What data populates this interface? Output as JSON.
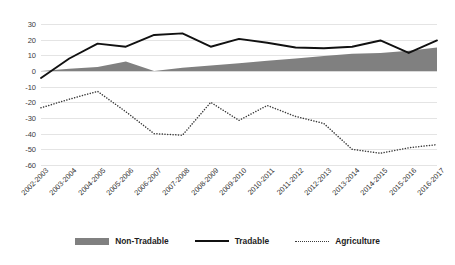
{
  "chart_data": {
    "type": "line",
    "title": "",
    "xlabel": "",
    "ylabel": "",
    "ylim": [
      -60,
      30
    ],
    "yticks": [
      30,
      20,
      10,
      0,
      -10,
      -20,
      -30,
      -40,
      -50,
      -60
    ],
    "grid": true,
    "legend_position": "bottom",
    "categories": [
      "2002-2003",
      "2003-2004",
      "2004-2005",
      "2005-2006",
      "2006-2007",
      "2007-2008",
      "2008-2009",
      "2009-2010",
      "2010-2011",
      "2011-2012",
      "2012-2013",
      "2013-2014",
      "2014-2015",
      "2015-2016",
      "2016-2017"
    ],
    "series": [
      {
        "name": "Non-Tradable",
        "style": "area",
        "color": "#808080",
        "values": [
          0,
          1.5,
          2.5,
          6,
          0,
          2,
          3.5,
          5,
          6.5,
          8,
          9.5,
          11,
          11.5,
          13,
          15
        ]
      },
      {
        "name": "Tradable",
        "style": "solid-line",
        "color": "#111111",
        "values": [
          -4.5,
          8,
          17.5,
          15.5,
          23,
          24,
          15.5,
          20.5,
          18,
          15,
          14.5,
          15.5,
          19.5,
          11.5,
          19.5
        ]
      },
      {
        "name": "Agriculture",
        "style": "dotted-line",
        "color": "#3a3a3a",
        "values": [
          -23.5,
          -18,
          -13,
          -26,
          -40,
          -41,
          -20,
          -31.5,
          -22,
          -29,
          -33.5,
          -50,
          -52.5,
          -49,
          -47
        ]
      }
    ]
  },
  "legend": {
    "items": [
      {
        "label": "Non-Tradable",
        "swatch": "area-swatch"
      },
      {
        "label": "Tradable",
        "swatch": "solid-line-swatch"
      },
      {
        "label": "Agriculture",
        "swatch": "dotted-line-swatch"
      }
    ]
  }
}
